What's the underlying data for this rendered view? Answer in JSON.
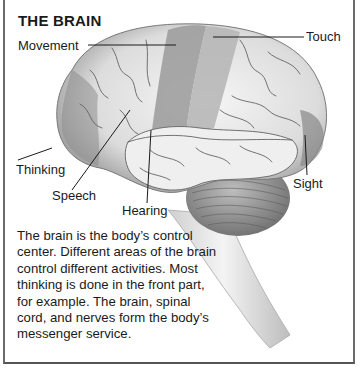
{
  "title": "THE BRAIN",
  "labels": {
    "movement": "Movement",
    "touch": "Touch",
    "thinking": "Thinking",
    "speech": "Speech",
    "hearing": "Hearing",
    "sight": "Sight"
  },
  "caption": "The brain is the body’s control center. Different areas of the brain control different activities. Most thinking is done in the front part, for example. The brain, spinal cord, and nerves form the body’s messenger service.",
  "colors": {
    "frame": "#6a6a6a",
    "highlight_region": "#9a9a9a",
    "brain_base": "#e9e9e9",
    "text": "#1a1a1a"
  }
}
